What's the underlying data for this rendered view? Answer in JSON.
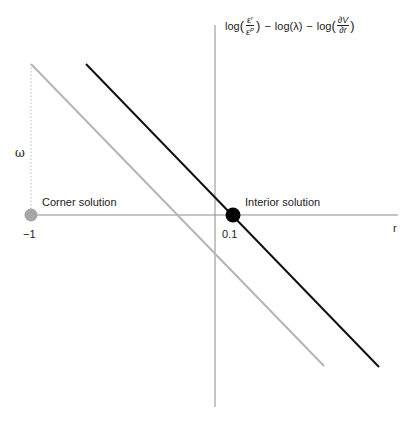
{
  "diagram": {
    "y_axis_label": {
      "log1": "log",
      "frac1_num_base": "ε",
      "frac1_num_sup": "r",
      "frac1_den_base": "ε",
      "frac1_den_sup": "P",
      "minus1": "−",
      "log2": "log",
      "lambda": "(λ)",
      "minus2": "−",
      "log3": "log",
      "frac3_num": "∂V",
      "frac3_den": "∂r",
      "open_paren": "(",
      "close_paren": ")"
    },
    "x_axis_label": "r",
    "omega_label": "ω",
    "corner_label": "Corner solution",
    "interior_label": "Interior solution",
    "tick_minus_one": "−1",
    "tick_point_one": "0.1",
    "colors": {
      "axis": "#8c8c8c",
      "gray_line": "#b5b5b5",
      "black_line": "#111111",
      "gray_dot": "#a6a6a6",
      "black_dot": "#000000",
      "dotted": "#bbbbbb"
    }
  }
}
